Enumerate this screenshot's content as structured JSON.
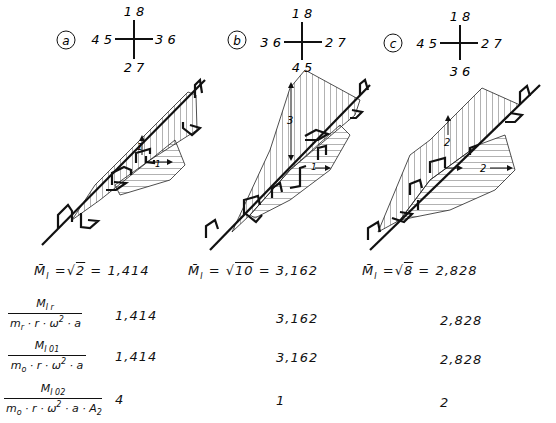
{
  "variants": [
    {
      "id": "a",
      "label": "a",
      "crank_positions": {
        "top": "1 8",
        "left": "4 5",
        "right": "3 6",
        "bottom": "2 7"
      },
      "moment_annotations": [
        "1",
        "1"
      ],
      "mbar_formula": {
        "symbol": "M̄",
        "subscript": "I",
        "sqrt_arg": "2",
        "value": "1,414"
      }
    },
    {
      "id": "b",
      "label": "b",
      "crank_positions": {
        "top": "1 8",
        "left": "3 6",
        "right": "2 7",
        "bottom": "4 5"
      },
      "moment_annotations": [
        "3",
        "1"
      ],
      "mbar_formula": {
        "symbol": "M̄",
        "subscript": "I",
        "sqrt_arg": "10",
        "value": "3,162"
      }
    },
    {
      "id": "c",
      "label": "c",
      "crank_positions": {
        "top": "1 8",
        "left": "4 5",
        "right": "2 7",
        "bottom": "3 6"
      },
      "moment_annotations": [
        "2",
        "2"
      ],
      "mbar_formula": {
        "symbol": "M̄",
        "subscript": "I",
        "sqrt_arg": "8",
        "value": "2,828"
      }
    }
  ],
  "table": {
    "rows": [
      {
        "numerator": "M",
        "numerator_sub": "I r",
        "denominator": "m_r · r · ω² · a",
        "values": [
          "1,414",
          "3,162",
          "2,828"
        ]
      },
      {
        "numerator": "M",
        "numerator_sub": "I 01",
        "denominator": "m_o · r · ω² · a",
        "values": [
          "1,414",
          "3,162",
          "2,828"
        ]
      },
      {
        "numerator": "M",
        "numerator_sub": "I 02",
        "denominator": "m_o · r · ω² · a · A₂",
        "values": [
          "4",
          "1",
          "2"
        ]
      }
    ]
  },
  "labels": {
    "equals": "=",
    "sqrt": "√",
    "mbar": "M̄",
    "mbar_sub": "I",
    "den_mr": "m",
    "den_mr_sub": "r",
    "den_mo": "m",
    "den_mo_sub": "o",
    "den_rest1": " · r · ω",
    "den_sq": "2",
    "den_rest2": " · a",
    "den_rest3": " · a · A",
    "den_a2_sub": "2"
  }
}
